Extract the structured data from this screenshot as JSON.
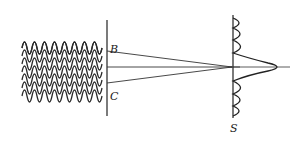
{
  "diagram": {
    "labels": {
      "slit_top": "B",
      "slit_bottom": "C",
      "screen": "S"
    },
    "wavefronts": {
      "rows": 7,
      "peaks_per_row": 8
    },
    "screen_pattern": {
      "central_maximum": true,
      "side_fringes_above": 3,
      "side_fringes_below": 3
    },
    "colors": {
      "stroke": "#222222",
      "background": "#ffffff"
    }
  }
}
